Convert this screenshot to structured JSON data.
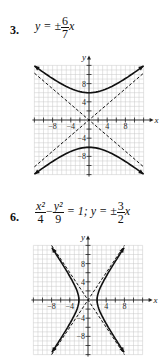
{
  "problems": [
    {
      "number": "3.",
      "equation": {
        "prefix": "y = ±",
        "frac_num": "6",
        "frac_den": "7",
        "suffix": "x"
      }
    },
    {
      "number": "6.",
      "equation": {
        "frac1_num": "x²",
        "frac1_den": "4",
        "minus": "−",
        "frac2_num": "y²",
        "frac2_den": "9",
        "mid": "= 1; y = ±",
        "frac3_num": "3",
        "frac3_den": "2",
        "suffix": "x"
      }
    }
  ],
  "colors": {
    "grid": "#c8c8c8",
    "axis": "#222222",
    "curve": "#111111"
  },
  "chart_data": [
    {
      "type": "line",
      "title": "y = ±(6/7)x",
      "xlabel": "x",
      "ylabel": "y",
      "xlim": [
        -12,
        12
      ],
      "ylim": [
        -12,
        12
      ],
      "grid": true,
      "x_ticks": [
        -8,
        -4,
        4,
        8
      ],
      "y_ticks": [
        8,
        4,
        -4,
        -8
      ],
      "series": [
        {
          "name": "hyperbola upper branch (y²/36 − x²/49 = 1)",
          "style": "solid",
          "x": [
            -12,
            -8,
            -4,
            0,
            4,
            8,
            12
          ],
          "y": [
            11.9,
            9.1,
            6.9,
            6,
            6.9,
            9.1,
            11.9
          ]
        },
        {
          "name": "hyperbola lower branch",
          "style": "solid",
          "x": [
            -12,
            -8,
            -4,
            0,
            4,
            8,
            12
          ],
          "y": [
            -11.9,
            -9.1,
            -6.9,
            -6,
            -6.9,
            -9.1,
            -11.9
          ]
        },
        {
          "name": "asymptote y = (6/7)x",
          "style": "dashed",
          "x": [
            -12,
            12
          ],
          "y": [
            -10.3,
            10.3
          ]
        },
        {
          "name": "asymptote y = -(6/7)x",
          "style": "dashed",
          "x": [
            -12,
            12
          ],
          "y": [
            10.3,
            -10.3
          ]
        }
      ]
    },
    {
      "type": "line",
      "title": "x²/4 − y²/9 = 1; y = ±(3/2)x",
      "xlabel": "x",
      "ylabel": "y",
      "xlim": [
        -12,
        12
      ],
      "ylim": [
        -12,
        12
      ],
      "grid": true,
      "x_ticks": [
        -8,
        -4,
        4,
        8
      ],
      "y_ticks": [
        8,
        4,
        -4,
        -8
      ],
      "series": [
        {
          "name": "hyperbola right branch",
          "style": "solid",
          "x": [
            8.1,
            4.7,
            2.8,
            2,
            2.8,
            4.7,
            8.1
          ],
          "y": [
            -12,
            -6,
            -3,
            0,
            3,
            6,
            12
          ]
        },
        {
          "name": "hyperbola left branch",
          "style": "solid",
          "x": [
            -8.1,
            -4.7,
            -2.8,
            -2,
            -2.8,
            -4.7,
            -8.1
          ],
          "y": [
            -12,
            -6,
            -3,
            0,
            3,
            6,
            12
          ]
        },
        {
          "name": "asymptote y = (3/2)x",
          "style": "dashed",
          "x": [
            -8,
            8
          ],
          "y": [
            -12,
            12
          ]
        },
        {
          "name": "asymptote y = -(3/2)x",
          "style": "dashed",
          "x": [
            -8,
            8
          ],
          "y": [
            12,
            -12
          ]
        }
      ]
    }
  ]
}
